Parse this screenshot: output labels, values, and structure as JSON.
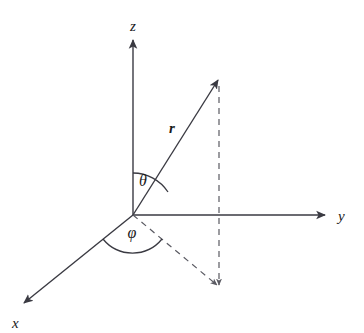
{
  "figure": {
    "background_color": "#ffffff",
    "stroke_color": "#3a3a42",
    "text_color": "#1a1a1a"
  },
  "axes": [
    {
      "id": "z",
      "label": "z",
      "description": "vertical axis pointing up",
      "from": [
        133,
        215
      ],
      "to": [
        133,
        40
      ],
      "label_pos": [
        133,
        31
      ],
      "arrow": true,
      "style": "solid"
    },
    {
      "id": "y",
      "label": "y",
      "description": "horizontal axis pointing right",
      "from": [
        133,
        215
      ],
      "to": [
        325,
        215
      ],
      "label_pos": [
        340,
        221
      ],
      "arrow": true,
      "style": "solid"
    },
    {
      "id": "x",
      "label": "x",
      "description": "oblique axis pointing down-left toward viewer",
      "from": [
        133,
        215
      ],
      "to": [
        22,
        305
      ],
      "label_pos": [
        11,
        325
      ],
      "arrow": true,
      "style": "solid"
    }
  ],
  "vectors": [
    {
      "id": "r",
      "label": "r",
      "description": "position vector from origin",
      "from": [
        133,
        215
      ],
      "to": [
        219,
        79
      ],
      "label_pos": [
        172,
        133
      ],
      "arrow": true,
      "style": "solid",
      "bold_label": true
    }
  ],
  "projections": [
    {
      "id": "vertical-drop",
      "description": "dashed vertical from vector tip down to xy-plane projection point",
      "from": [
        219,
        86
      ],
      "to": [
        219,
        287
      ],
      "arrow": true,
      "style": "dashed"
    },
    {
      "id": "xy-projection",
      "description": "dashed line from origin to projection point in xy-plane",
      "from": [
        133,
        215
      ],
      "to": [
        219,
        287
      ],
      "arrow": true,
      "style": "dashed"
    }
  ],
  "angles": [
    {
      "id": "theta",
      "label": "θ",
      "description": "polar angle between z-axis and r vector",
      "vertex": [
        133,
        215
      ],
      "radius": 42,
      "start_deg": 90,
      "end_deg": 57.7,
      "label_pos": [
        143,
        186
      ]
    },
    {
      "id": "phi",
      "label": "φ",
      "description": "azimuthal angle between x-axis and xy-plane projection",
      "vertex": [
        133,
        215
      ],
      "radius": 38,
      "start_deg": -140.9,
      "end_deg": -39.9,
      "label_pos": [
        132,
        237
      ]
    }
  ],
  "origin": {
    "label": "O",
    "pos": [
      133,
      215
    ],
    "visible": false
  }
}
